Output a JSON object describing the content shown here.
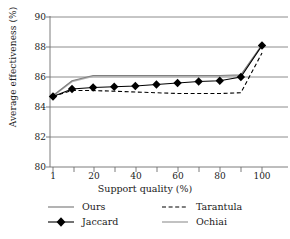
{
  "chart_data": {
    "type": "line",
    "title": "",
    "xlabel": "Support quality (%)",
    "ylabel": "Average effectiveness (%)",
    "xlim": [
      1,
      100
    ],
    "ylim": [
      80,
      90
    ],
    "xticks": [
      1,
      10,
      20,
      30,
      40,
      50,
      60,
      70,
      80,
      90,
      100
    ],
    "xtick_labels": [
      "1",
      "",
      "20",
      "",
      "40",
      "",
      "60",
      "",
      "80",
      "",
      "100"
    ],
    "yticks": [
      80,
      82,
      84,
      86,
      88,
      90
    ],
    "ytick_labels": [
      "80",
      "82",
      "84",
      "86",
      "88",
      "90"
    ],
    "grid": "horizontal",
    "legend_position": "below",
    "x": [
      1,
      10,
      20,
      30,
      40,
      50,
      60,
      70,
      80,
      90,
      100
    ],
    "series": [
      {
        "name": "Ours",
        "style": "solid",
        "color": "#808080",
        "marker": "none",
        "values": [
          84.75,
          85.75,
          86.1,
          86.1,
          86.1,
          86.1,
          86.1,
          86.1,
          86.1,
          86.15,
          88.15
        ]
      },
      {
        "name": "Jaccard",
        "style": "solid",
        "color": "#000000",
        "marker": "diamond",
        "values": [
          84.7,
          85.2,
          85.3,
          85.35,
          85.4,
          85.5,
          85.6,
          85.7,
          85.75,
          86.0,
          88.1
        ]
      },
      {
        "name": "Tarantula",
        "style": "dashed",
        "color": "#000000",
        "marker": "none",
        "values": [
          84.7,
          85.1,
          85.1,
          85.05,
          85.0,
          84.95,
          84.9,
          84.9,
          84.9,
          84.95,
          87.6
        ]
      },
      {
        "name": "Ochiai",
        "style": "solid",
        "color": "#b3b3b3",
        "marker": "none",
        "values": [
          84.75,
          85.7,
          86.05,
          86.05,
          86.05,
          86.05,
          86.05,
          86.05,
          86.05,
          86.1,
          88.1
        ]
      }
    ]
  },
  "legend": {
    "items": [
      {
        "label": "Ours",
        "key": "line-solid-gray"
      },
      {
        "label": "Tarantula",
        "key": "line-dashed-black"
      },
      {
        "label": "Jaccard",
        "key": "line-diamond-black"
      },
      {
        "label": "Ochiai",
        "key": "line-solid-lightgray"
      }
    ]
  },
  "colors": {
    "axis": "#6e6e6e",
    "grid": "#6e6e6e",
    "ours": "#808080",
    "jaccard": "#000000",
    "tarantula": "#000000",
    "ochiai": "#b3b3b3"
  }
}
